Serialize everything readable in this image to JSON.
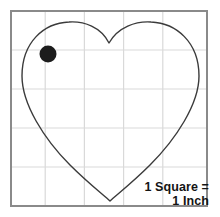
{
  "figure": {
    "background_color": "#ffffff",
    "width": 220,
    "height": 217
  },
  "grid": {
    "border_color": "#8a8a8a",
    "line_color": "#d9d9d9",
    "columns": 5,
    "rows": 5,
    "left": 11,
    "top": 11,
    "right": 207,
    "bottom": 206,
    "vertical_lines": [
      45.2,
      84.4,
      123.6,
      162.8
    ],
    "horizontal_lines": [
      50,
      89,
      128,
      167
    ],
    "square_size_label": "1 Inch"
  },
  "shape": {
    "name": "heart-outline",
    "stroke_color": "#3b3b3b",
    "fill": "none",
    "stroke_width": 1.4,
    "bottom_point": {
      "x": 110,
      "y": 201
    },
    "cleft_point": {
      "x": 109,
      "y": 43
    },
    "left_extreme_x": 22,
    "right_extreme_x": 199,
    "lobe_top_y": 23
  },
  "marker": {
    "name": "black-dot",
    "color": "#1c1c1c",
    "center_x": 48,
    "center_y": 54,
    "radius": 8.5
  },
  "legend": {
    "line1": "1 Square =",
    "line2": "1 Inch",
    "text_color": "#141414"
  }
}
